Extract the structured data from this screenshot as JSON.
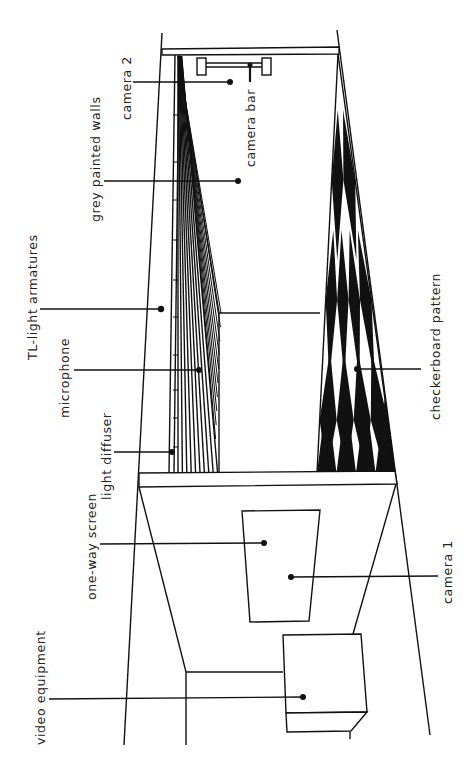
{
  "diagram": {
    "colors": {
      "ink": "#111111",
      "background": "#ffffff"
    },
    "labels": {
      "camera_2": "camera 2",
      "camera_bar": "camera bar",
      "grey_painted_walls": "grey painted walls",
      "tl_light_armatures": "TL-light armatures",
      "microphone": "microphone",
      "light_diffuser": "light diffuser",
      "checkerboard_pattern": "checkerboard pattern",
      "one_way_screen": "one-way screen",
      "camera_1": "camera 1",
      "video_equipment": "video equipment"
    }
  }
}
